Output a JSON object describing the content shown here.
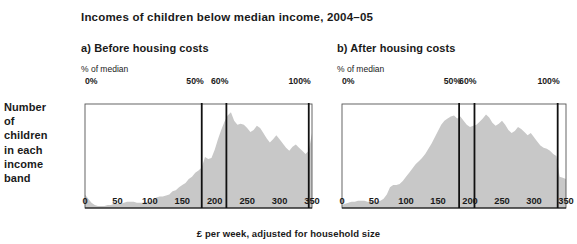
{
  "title": "Incomes of children below median income, 2004–05",
  "y_axis_label_lines": [
    "Number",
    "of",
    "children",
    "in each",
    "income",
    "band"
  ],
  "x_axis_label": "£ per week, adjusted for household size",
  "colors": {
    "fill": "#c8c8c8",
    "axis": "#111111",
    "text": "#1a1a1a",
    "background": "#ffffff"
  },
  "panels": [
    {
      "id": "a",
      "title": "a) Before housing costs",
      "pct_caption": "% of median",
      "top_labels": [
        {
          "text": "0%",
          "value": 0
        },
        {
          "text": "50%",
          "value": 180
        },
        {
          "text": "60%",
          "value": 218
        },
        {
          "text": "100%",
          "value": 345
        }
      ],
      "median_lines": [
        {
          "label": "50%",
          "value": 180
        },
        {
          "label": "60%",
          "value": 218
        },
        {
          "label": "100%",
          "value": 345
        }
      ],
      "tick_labels": [
        "0",
        "50",
        "100",
        "150",
        "200",
        "250",
        "300",
        "350"
      ]
    },
    {
      "id": "b",
      "title": "b) After housing costs",
      "pct_caption": "% of median",
      "top_labels": [
        {
          "text": "0%",
          "value": 0
        },
        {
          "text": "50%",
          "value": 183
        },
        {
          "text": "60%",
          "value": 207
        },
        {
          "text": "100%",
          "value": 337
        }
      ],
      "median_lines": [
        {
          "label": "50%",
          "value": 183
        },
        {
          "label": "60%",
          "value": 207
        },
        {
          "label": "100%",
          "value": 337
        }
      ],
      "tick_labels": [
        "0",
        "50",
        "100",
        "150",
        "200",
        "250",
        "300",
        "350"
      ]
    }
  ],
  "chart_data": [
    {
      "type": "area",
      "title": "a) Before housing costs",
      "xlabel": "£ per week, adjusted for household size",
      "ylabel": "Number of children in each income band",
      "xlim": [
        0,
        350
      ],
      "ylim": [
        0,
        100
      ],
      "grid": false,
      "annotations": [
        {
          "label": "0%",
          "x": 0
        },
        {
          "label": "50%",
          "x": 180
        },
        {
          "label": "60%",
          "x": 218
        },
        {
          "label": "100%",
          "x": 345
        }
      ],
      "x": [
        0,
        5,
        10,
        15,
        20,
        25,
        30,
        35,
        40,
        45,
        50,
        55,
        60,
        65,
        70,
        75,
        80,
        85,
        90,
        95,
        100,
        105,
        110,
        115,
        120,
        125,
        130,
        135,
        140,
        145,
        150,
        155,
        160,
        165,
        170,
        175,
        180,
        185,
        190,
        195,
        200,
        205,
        210,
        215,
        220,
        225,
        230,
        235,
        240,
        245,
        250,
        255,
        260,
        265,
        270,
        275,
        280,
        285,
        290,
        295,
        300,
        305,
        310,
        315,
        320,
        325,
        330,
        335,
        340,
        345,
        350
      ],
      "values": [
        13,
        9,
        5,
        3,
        2,
        2,
        2,
        3,
        3,
        4,
        4,
        4,
        5,
        6,
        6,
        6,
        5,
        5,
        5,
        6,
        6,
        7,
        10,
        11,
        11,
        12,
        13,
        16,
        17,
        20,
        22,
        24,
        28,
        30,
        34,
        36,
        39,
        49,
        47,
        48,
        56,
        66,
        75,
        83,
        89,
        92,
        84,
        80,
        81,
        80,
        77,
        73,
        75,
        79,
        77,
        72,
        67,
        63,
        66,
        70,
        66,
        62,
        58,
        55,
        59,
        61,
        58,
        55,
        52,
        55,
        72
      ]
    },
    {
      "type": "area",
      "title": "b) After housing costs",
      "xlabel": "£ per week, adjusted for household size",
      "ylabel": "Number of children in each income band",
      "xlim": [
        0,
        350
      ],
      "ylim": [
        0,
        100
      ],
      "grid": false,
      "annotations": [
        {
          "label": "0%",
          "x": 0
        },
        {
          "label": "50%",
          "x": 183
        },
        {
          "label": "60%",
          "x": 207
        },
        {
          "label": "100%",
          "x": 337
        }
      ],
      "x": [
        0,
        5,
        10,
        15,
        20,
        25,
        30,
        35,
        40,
        45,
        50,
        55,
        60,
        65,
        70,
        75,
        80,
        85,
        90,
        95,
        100,
        105,
        110,
        115,
        120,
        125,
        130,
        135,
        140,
        145,
        150,
        155,
        160,
        165,
        170,
        175,
        180,
        185,
        190,
        195,
        200,
        205,
        210,
        215,
        220,
        225,
        230,
        235,
        240,
        245,
        250,
        255,
        260,
        265,
        270,
        275,
        280,
        285,
        290,
        295,
        300,
        305,
        310,
        315,
        320,
        325,
        330,
        335,
        340,
        345,
        350
      ],
      "values": [
        3,
        4,
        5,
        6,
        6,
        7,
        7,
        7,
        6,
        6,
        6,
        6,
        7,
        9,
        13,
        20,
        22,
        22,
        23,
        26,
        30,
        34,
        38,
        42,
        45,
        48,
        52,
        57,
        62,
        68,
        74,
        80,
        84,
        86,
        88,
        89,
        86,
        88,
        84,
        80,
        78,
        79,
        80,
        83,
        86,
        90,
        87,
        82,
        79,
        81,
        84,
        80,
        75,
        72,
        74,
        78,
        76,
        73,
        70,
        72,
        68,
        64,
        60,
        58,
        57,
        55,
        52,
        50,
        30,
        29,
        28
      ]
    }
  ]
}
